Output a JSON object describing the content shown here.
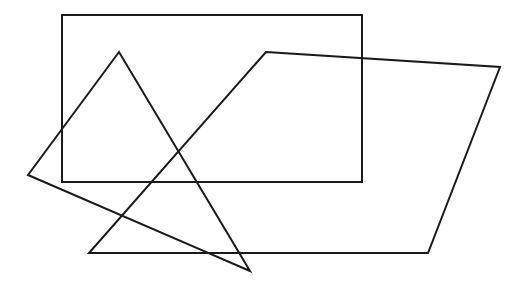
{
  "canvas": {
    "width": 523,
    "height": 289,
    "background": "#ffffff"
  },
  "stroke": {
    "color": "#1a1a1a",
    "width": 2
  },
  "shapes": {
    "rectangle": {
      "x": 62,
      "y": 15,
      "width": 300,
      "height": 167
    },
    "triangle": {
      "points": "119,52 28,175 250,271"
    },
    "quadrilateral": {
      "points": "266,52 500,67 428,253 89,253"
    }
  }
}
